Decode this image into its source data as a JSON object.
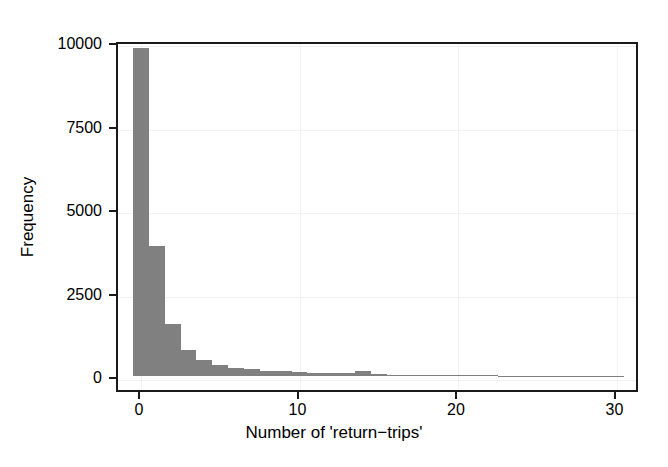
{
  "chart_data": {
    "type": "bar",
    "title": "",
    "subtitle": "",
    "xlabel": "Number of 'return−trips'",
    "ylabel": "Frequency",
    "xlim": [
      -1.2,
      31.5
    ],
    "ylim": [
      0,
      10400
    ],
    "xticks": [
      0,
      10,
      20,
      30
    ],
    "xtick_labels": [
      "0",
      "10",
      "20",
      "30"
    ],
    "yticks": [
      0,
      2500,
      5000,
      7500,
      10000
    ],
    "ytick_labels": [
      "0",
      "2500",
      "5000",
      "7500",
      "10000"
    ],
    "grid": true,
    "legend": null,
    "bar_color": "#808080",
    "bin_width": 1,
    "categories": [
      0,
      1,
      2,
      3,
      4,
      5,
      6,
      7,
      8,
      9,
      10,
      11,
      12,
      13,
      14,
      15,
      16,
      17,
      18,
      19,
      20,
      21,
      22,
      23,
      24,
      25,
      26,
      27,
      28,
      29,
      30
    ],
    "values": [
      9820,
      3900,
      1560,
      780,
      470,
      330,
      250,
      200,
      165,
      140,
      120,
      105,
      95,
      85,
      150,
      60,
      45,
      38,
      32,
      28,
      24,
      20,
      17,
      15,
      13,
      11,
      9,
      8,
      7,
      6,
      5
    ]
  },
  "axes": {
    "frame_color": "#1a1a1a",
    "grid_color": "#f2f2f2",
    "background": "#ffffff"
  }
}
